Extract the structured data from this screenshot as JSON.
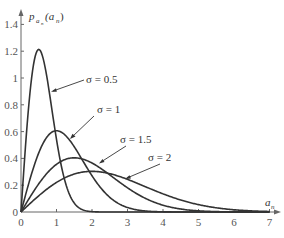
{
  "chart_data": {
    "type": "line",
    "title": "",
    "xlabel": "a_n",
    "ylabel": "p_{a_n}(a_n)",
    "xlim": [
      0,
      7
    ],
    "ylim": [
      0,
      1.4
    ],
    "x_ticks": [
      "0",
      "1",
      "2",
      "3",
      "4",
      "5",
      "6",
      "7"
    ],
    "y_ticks": [
      "0",
      "0.2",
      "0.4",
      "0.6",
      "0.8",
      "1",
      "1.2",
      "1.4"
    ],
    "grid": false,
    "legend": "inline annotations with leader arrows",
    "series": [
      {
        "name": "σ = 0.5",
        "sigma": 0.5,
        "peak_x": 0.5,
        "peak_y": 1.21,
        "x": [
          0,
          0.25,
          0.5,
          0.75,
          1.0,
          1.5,
          2.0
        ],
        "values": [
          0,
          0.88,
          1.21,
          0.97,
          0.54,
          0.07,
          0.0
        ]
      },
      {
        "name": "σ = 1",
        "sigma": 1,
        "peak_x": 1,
        "peak_y": 0.61,
        "x": [
          0,
          0.5,
          1,
          1.5,
          2,
          3,
          4
        ],
        "values": [
          0,
          0.44,
          0.61,
          0.49,
          0.27,
          0.03,
          0.0
        ]
      },
      {
        "name": "σ = 1.5",
        "sigma": 1.5,
        "peak_x": 1.5,
        "peak_y": 0.4,
        "x": [
          0,
          1,
          1.5,
          2,
          3,
          4,
          5,
          6
        ],
        "values": [
          0,
          0.36,
          0.4,
          0.37,
          0.18,
          0.05,
          0.01,
          0.0
        ]
      },
      {
        "name": "σ = 2",
        "sigma": 2,
        "peak_x": 2,
        "peak_y": 0.3,
        "x": [
          0,
          1,
          2,
          3,
          4,
          5,
          6,
          7
        ],
        "values": [
          0,
          0.22,
          0.3,
          0.24,
          0.14,
          0.05,
          0.01,
          0.0
        ]
      }
    ]
  },
  "labels": {
    "ylabel_main": "p",
    "ylabel_sub": "a",
    "ylabel_subsub": "n",
    "ylabel_arg": "(a",
    "ylabel_arg_sub": "n",
    "ylabel_close": ")",
    "xlabel_main": "a",
    "xlabel_sub": "n",
    "anno": [
      "σ = 0.5",
      "σ = 1",
      "σ = 1.5",
      "σ = 2"
    ]
  }
}
